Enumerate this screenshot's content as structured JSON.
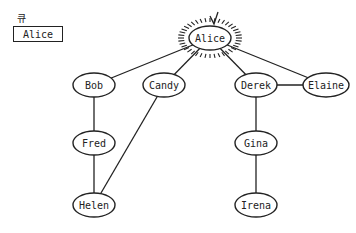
{
  "queue": {
    "label": "큐",
    "items": [
      "Alice"
    ]
  },
  "graph": {
    "highlighted": "Alice",
    "nodes": [
      {
        "id": "Alice",
        "label": "Alice",
        "x": 210,
        "y": 38
      },
      {
        "id": "Bob",
        "label": "Bob",
        "x": 94,
        "y": 85
      },
      {
        "id": "Candy",
        "label": "Candy",
        "x": 164,
        "y": 85
      },
      {
        "id": "Derek",
        "label": "Derek",
        "x": 256,
        "y": 85
      },
      {
        "id": "Elaine",
        "label": "Elaine",
        "x": 326,
        "y": 85
      },
      {
        "id": "Fred",
        "label": "Fred",
        "x": 94,
        "y": 143
      },
      {
        "id": "Gina",
        "label": "Gina",
        "x": 256,
        "y": 143
      },
      {
        "id": "Helen",
        "label": "Helen",
        "x": 94,
        "y": 205
      },
      {
        "id": "Irena",
        "label": "Irena",
        "x": 256,
        "y": 205
      }
    ],
    "edges": [
      [
        "Alice",
        "Bob"
      ],
      [
        "Alice",
        "Candy"
      ],
      [
        "Alice",
        "Derek"
      ],
      [
        "Alice",
        "Elaine"
      ],
      [
        "Derek",
        "Elaine"
      ],
      [
        "Bob",
        "Fred"
      ],
      [
        "Fred",
        "Helen"
      ],
      [
        "Candy",
        "Helen"
      ],
      [
        "Derek",
        "Gina"
      ],
      [
        "Gina",
        "Irena"
      ]
    ],
    "colors": {
      "stroke": "#222222",
      "fill": "#ffffff"
    }
  }
}
